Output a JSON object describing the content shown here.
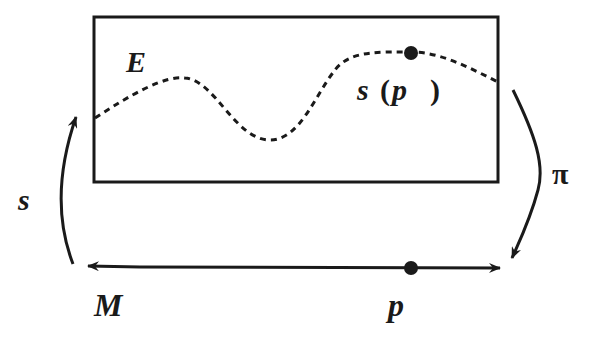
{
  "diagram": {
    "labels": {
      "total_space": "E",
      "section_point": "s",
      "section_paren_open": "(",
      "section_arg": "p",
      "section_paren_close": ")",
      "section_map": "s",
      "projection_map": "π",
      "base_space": "M",
      "base_point": "p"
    },
    "colors": {
      "ink": "#1a1a1a",
      "background": "#ffffff"
    }
  }
}
